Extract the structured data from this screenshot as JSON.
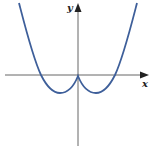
{
  "figure": {
    "x_axis_label": "x",
    "y_axis_label": "y",
    "curve_color": "#3e5f9a",
    "axis_color": "#555555"
  }
}
